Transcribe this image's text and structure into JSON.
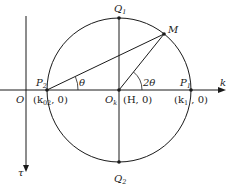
{
  "diagram": {
    "axes": {
      "horizontal_label": "k",
      "vertical_label": "τ",
      "origin_label": "O"
    },
    "circle": {
      "center_label": "O",
      "center_sub": "k",
      "center_coord": "(H, 0)"
    },
    "points": {
      "P1": {
        "label": "P",
        "sub": "1",
        "coord_pre": "(k",
        "coord_sub": "1",
        "coord_post": " , 0)"
      },
      "P2": {
        "label": "P",
        "sub": "2",
        "coord_pre": "(k",
        "coord_sub": "02",
        "coord_post": ", 0)"
      },
      "Q1": {
        "label": "Q",
        "sub": "1"
      },
      "Q2": {
        "label": "Q",
        "sub": "2"
      },
      "M": {
        "label": "M"
      }
    },
    "angles": {
      "theta": "θ",
      "two_theta": "2θ"
    },
    "colors": {
      "line": "#1a1a1a",
      "background": "#ffffff"
    }
  }
}
